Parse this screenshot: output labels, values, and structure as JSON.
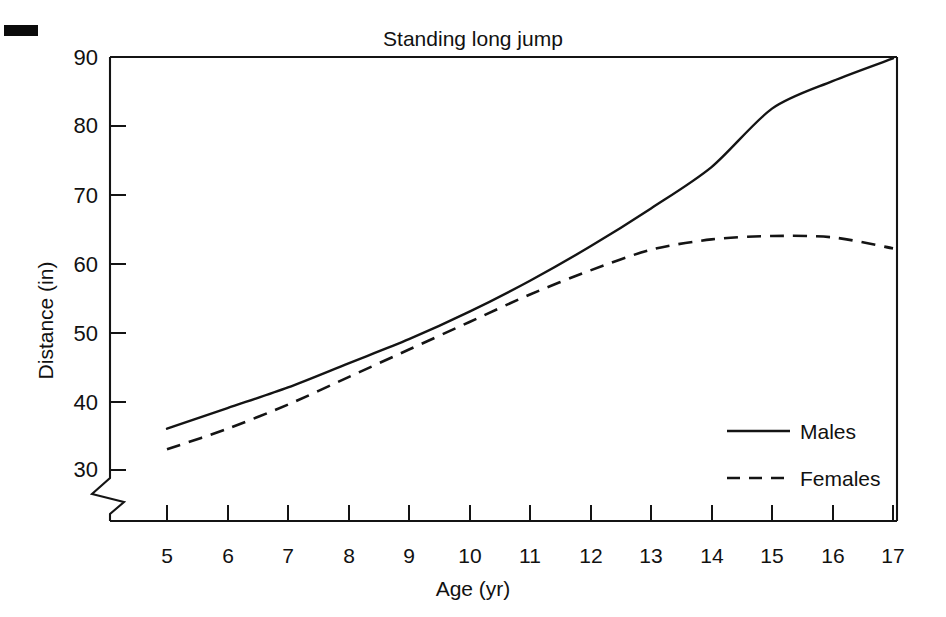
{
  "chart_data": {
    "type": "line",
    "title": "Standing long jump",
    "xlabel": "Age (yr)",
    "ylabel": "Distance (in)",
    "x": [
      5,
      6,
      7,
      8,
      9,
      10,
      11,
      12,
      13,
      14,
      15,
      16,
      17
    ],
    "xtick_labels": [
      "5",
      "6",
      "7",
      "8",
      "9",
      "10",
      "11",
      "12",
      "13",
      "14",
      "15",
      "16",
      "17"
    ],
    "ytick_labels": [
      "30",
      "40",
      "50",
      "60",
      "70",
      "80",
      "90"
    ],
    "yticks": [
      30,
      40,
      50,
      60,
      70,
      80,
      90
    ],
    "xlim": [
      4.6,
      17.0
    ],
    "ylim": [
      27.5,
      90
    ],
    "y_axis_break": true,
    "grid": false,
    "legend_position": "inside-lower-right",
    "series": [
      {
        "name": "Males",
        "style": "solid",
        "values": [
          36.0,
          39.0,
          42.0,
          45.5,
          49.0,
          53.0,
          57.5,
          62.5,
          68.0,
          74.0,
          82.5,
          86.5,
          89.8
        ]
      },
      {
        "name": "Females",
        "style": "dashed",
        "values": [
          33.0,
          36.0,
          39.5,
          43.5,
          47.5,
          51.5,
          55.5,
          59.0,
          62.0,
          63.5,
          64.0,
          63.8,
          62.2
        ]
      }
    ]
  },
  "legend": {
    "items": [
      {
        "label": "Males",
        "style": "solid"
      },
      {
        "label": "Females",
        "style": "dashed"
      }
    ]
  },
  "colors": {
    "ink": "#141414",
    "background": "#ffffff"
  }
}
